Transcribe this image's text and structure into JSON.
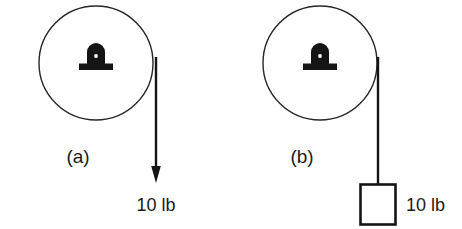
{
  "figure": {
    "background_color": "#ffffff",
    "stroke_color": "#1a1a1a",
    "width": 462,
    "height": 229
  },
  "panels": [
    {
      "id": "a",
      "label": "(a)",
      "label_x": 78,
      "label_y": 163,
      "pulley": {
        "cx": 96,
        "cy": 63,
        "r": 57,
        "mount_icon": "pulley-axle-mount-icon"
      },
      "rope": {
        "x": 156,
        "y_top": 57,
        "y_bottom": 168,
        "terminator": "arrowhead-down"
      },
      "force": {
        "value": "10 lb",
        "label_x": 156,
        "label_y": 211
      }
    },
    {
      "id": "b",
      "label": "(b)",
      "label_x": 302,
      "label_y": 163,
      "pulley": {
        "cx": 320,
        "cy": 63,
        "r": 57,
        "mount_icon": "pulley-axle-mount-icon"
      },
      "rope": {
        "x": 378,
        "y_top": 57,
        "y_bottom": 184,
        "terminator": "hanging-weight-box"
      },
      "weight_box": {
        "x": 360,
        "y": 184,
        "width": 36,
        "height": 41
      },
      "force": {
        "value": "10 lb",
        "label_x": 406,
        "label_y": 211
      }
    }
  ]
}
